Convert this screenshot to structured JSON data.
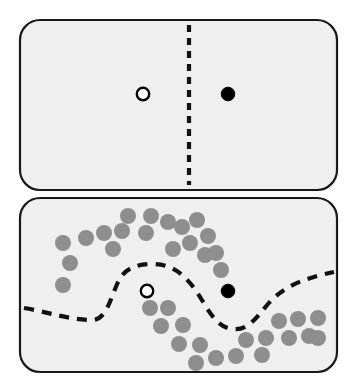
{
  "figure": {
    "width": 357,
    "height": 391,
    "background_color": "#ffffff"
  },
  "colors": {
    "panel_fill": "#efefef",
    "panel_stroke": "#1a1a1a",
    "boundary_stroke": "#111111",
    "unlabeled_point": "#8e8e8e",
    "negative_class_marker": "#ffffff",
    "positive_class_marker": "#000000"
  },
  "panels": [
    {
      "id": "top-panel",
      "name": "supervised-only-panel",
      "label": "",
      "rect": {
        "x": 20,
        "y": 20,
        "width": 317,
        "height": 170,
        "rx": 20
      },
      "boundary": {
        "type": "straight-vertical-dashed",
        "path": "M 189 25 L 189 185",
        "dash": "7 6",
        "width": 4.2
      },
      "markers": [
        {
          "name": "open-circle-marker",
          "class_label": "negative",
          "style": "open",
          "cx": 143,
          "cy": 94,
          "r": 6.2
        },
        {
          "name": "filled-circle-marker",
          "class_label": "positive",
          "style": "filled",
          "cx": 228,
          "cy": 94,
          "r": 6.8
        }
      ],
      "unlabeled_points": []
    },
    {
      "id": "bottom-panel",
      "name": "semi-supervised-panel",
      "label": "",
      "rect": {
        "x": 20,
        "y": 198,
        "width": 317,
        "height": 174,
        "rx": 20
      },
      "boundary": {
        "type": "curved-dashed",
        "path": "M 24 308 C 48 312, 70 320, 92 320 C 106 320, 110 300, 118 282 C 124 269, 136 264, 152 264 C 170 264, 182 272, 194 288 C 206 304, 214 327, 232 329 C 248 331, 256 318, 268 304 C 282 288, 300 279, 334 272",
        "dash": "10 8",
        "width": 4.2
      },
      "markers": [
        {
          "name": "open-circle-marker",
          "class_label": "negative",
          "style": "open",
          "cx": 147,
          "cy": 291,
          "r": 6.2
        },
        {
          "name": "filled-circle-marker",
          "class_label": "positive",
          "style": "filled",
          "cx": 228,
          "cy": 291,
          "r": 6.8
        }
      ],
      "unlabeled_points": [
        {
          "cx": 63,
          "cy": 243,
          "r": 8
        },
        {
          "cx": 70,
          "cy": 263,
          "r": 8
        },
        {
          "cx": 63,
          "cy": 285,
          "r": 8
        },
        {
          "cx": 86,
          "cy": 238,
          "r": 8
        },
        {
          "cx": 104,
          "cy": 233,
          "r": 8
        },
        {
          "cx": 113,
          "cy": 249,
          "r": 8
        },
        {
          "cx": 122,
          "cy": 231,
          "r": 8
        },
        {
          "cx": 128,
          "cy": 216,
          "r": 8
        },
        {
          "cx": 146,
          "cy": 233,
          "r": 8
        },
        {
          "cx": 151,
          "cy": 216,
          "r": 8
        },
        {
          "cx": 168,
          "cy": 222,
          "r": 8
        },
        {
          "cx": 182,
          "cy": 227,
          "r": 8
        },
        {
          "cx": 190,
          "cy": 243,
          "r": 8
        },
        {
          "cx": 173,
          "cy": 249,
          "r": 8
        },
        {
          "cx": 197,
          "cy": 220,
          "r": 8
        },
        {
          "cx": 208,
          "cy": 236,
          "r": 8
        },
        {
          "cx": 205,
          "cy": 255,
          "r": 8
        },
        {
          "cx": 216,
          "cy": 253,
          "r": 8
        },
        {
          "cx": 221,
          "cy": 270,
          "r": 8
        },
        {
          "cx": 150,
          "cy": 308,
          "r": 8
        },
        {
          "cx": 168,
          "cy": 308,
          "r": 8
        },
        {
          "cx": 161,
          "cy": 326,
          "r": 8
        },
        {
          "cx": 183,
          "cy": 325,
          "r": 8
        },
        {
          "cx": 179,
          "cy": 344,
          "r": 8
        },
        {
          "cx": 200,
          "cy": 345,
          "r": 8
        },
        {
          "cx": 196,
          "cy": 363,
          "r": 8
        },
        {
          "cx": 216,
          "cy": 358,
          "r": 8
        },
        {
          "cx": 236,
          "cy": 356,
          "r": 8
        },
        {
          "cx": 246,
          "cy": 340,
          "r": 8
        },
        {
          "cx": 266,
          "cy": 338,
          "r": 8
        },
        {
          "cx": 262,
          "cy": 355,
          "r": 8
        },
        {
          "cx": 279,
          "cy": 321,
          "r": 8
        },
        {
          "cx": 289,
          "cy": 338,
          "r": 8
        },
        {
          "cx": 298,
          "cy": 319,
          "r": 8
        },
        {
          "cx": 309,
          "cy": 336,
          "r": 8
        },
        {
          "cx": 318,
          "cy": 318,
          "r": 8
        },
        {
          "cx": 318,
          "cy": 338,
          "r": 8
        }
      ]
    }
  ]
}
